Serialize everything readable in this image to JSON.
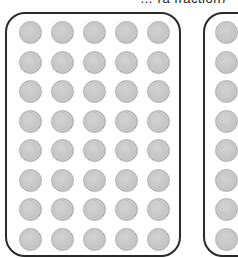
{
  "caption": "… (a fraction)",
  "panels": [
    {
      "name": "left-panel",
      "rows": 8,
      "cols": 5
    },
    {
      "name": "right-panel",
      "rows": 8,
      "cols": 1,
      "cropped": true
    }
  ],
  "colors": {
    "dot_fill": "#c8c8c8",
    "dot_border": "#b2b2b2",
    "panel_border": "#2a2a2a"
  }
}
